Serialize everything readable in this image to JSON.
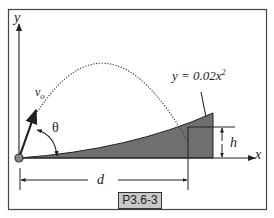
{
  "figure": {
    "id_label": "P3.6-3",
    "equation_label": "y = 0.02x²",
    "equation_prefix": "y = 0.02x",
    "equation_exponent": "2",
    "axis_x_label": "x",
    "axis_y_label": "y",
    "velocity_label": "v",
    "velocity_subscript": "o",
    "angle_label": "θ",
    "distance_label": "d",
    "height_label": "h",
    "colors": {
      "border": "#444444",
      "line": "#222222",
      "shade": "#707070",
      "tag_bg": "#c8c8c8"
    }
  }
}
